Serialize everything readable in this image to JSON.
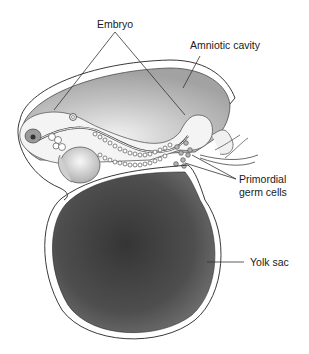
{
  "diagram": {
    "type": "anatomical-illustration",
    "labels": {
      "embryo": "Embryo",
      "amniotic_cavity": "Amniotic cavity",
      "primordial_line1": "Primordial",
      "primordial_line2": "germ cells",
      "yolk_sac": "Yolk sac"
    },
    "colors": {
      "background": "#ffffff",
      "outline": "#3a3a3a",
      "amniotic_fill_light": "#e6e6e6",
      "amniotic_fill_dark": "#a8a8a8",
      "yolk_fill_center": "#3c3c3c",
      "yolk_fill_edge": "#6a6a6a",
      "embryo_tissue": "#f4f4f4",
      "leader_line": "#333333"
    }
  }
}
